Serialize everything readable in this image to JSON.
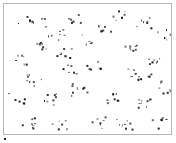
{
  "image": {
    "description": "Micrograph of scattered dark particles on a white background",
    "frame": {
      "border_color": "#b8b8b8",
      "background": "#ffffff"
    },
    "particle_color": "#1a1a1a",
    "clusters": [
      [
        22,
        14,
        6
      ],
      [
        38,
        40,
        9
      ],
      [
        15,
        55,
        6
      ],
      [
        52,
        30,
        7
      ],
      [
        70,
        12,
        6
      ],
      [
        60,
        48,
        8
      ],
      [
        30,
        75,
        8
      ],
      [
        12,
        95,
        6
      ],
      [
        45,
        95,
        8
      ],
      [
        25,
        118,
        9
      ],
      [
        55,
        120,
        7
      ],
      [
        75,
        85,
        9
      ],
      [
        90,
        60,
        8
      ],
      [
        100,
        25,
        7
      ],
      [
        115,
        10,
        6
      ],
      [
        125,
        40,
        8
      ],
      [
        140,
        18,
        7
      ],
      [
        158,
        30,
        6
      ],
      [
        150,
        55,
        7
      ],
      [
        130,
        70,
        9
      ],
      [
        110,
        95,
        8
      ],
      [
        140,
        100,
        9
      ],
      [
        160,
        85,
        6
      ],
      [
        120,
        120,
        8
      ],
      [
        95,
        118,
        7
      ],
      [
        155,
        118,
        6
      ],
      [
        80,
        35,
        5
      ],
      [
        65,
        65,
        6
      ],
      [
        35,
        20,
        4
      ],
      [
        150,
        75,
        5
      ]
    ]
  },
  "marker": {
    "x": 5,
    "y": 139
  }
}
